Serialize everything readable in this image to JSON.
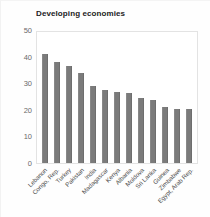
{
  "chart_data": {
    "type": "bar",
    "title": "Developing economies",
    "xlabel": "",
    "ylabel": "",
    "ylim": [
      0,
      50
    ],
    "yticks": [
      0,
      10,
      20,
      30,
      40,
      50
    ],
    "grid": false,
    "legend": null,
    "bar_color": "#7b7b7b",
    "categories": [
      "Lebanon",
      "Congo, Rep.",
      "Turkey",
      "Pakistan",
      "India",
      "Madagascar",
      "Kenya",
      "Albania",
      "Moldova",
      "Sri Lanka",
      "Guinea",
      "Zimbabwe",
      "Egypt, Arab Rep."
    ],
    "values": [
      41.5,
      38.5,
      37.0,
      34.5,
      29.5,
      28.0,
      27.0,
      26.8,
      24.8,
      24.0,
      21.5,
      20.8,
      20.5
    ]
  }
}
